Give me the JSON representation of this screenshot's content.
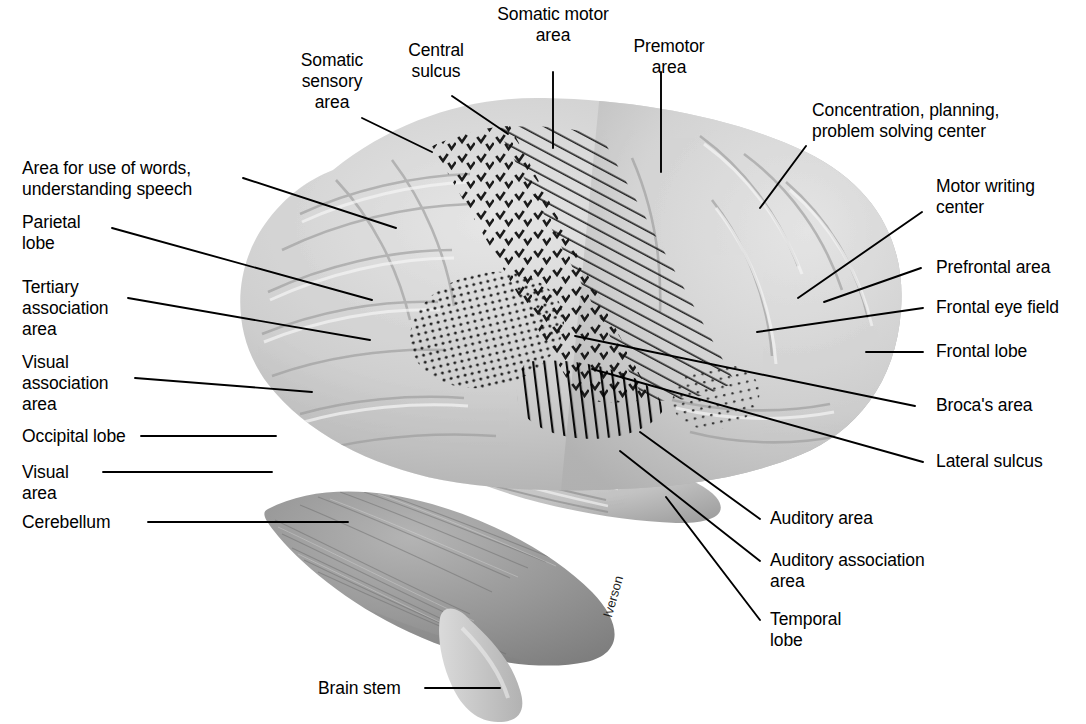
{
  "figure": {
    "type": "anatomical-diagram",
    "background_color": "#ffffff",
    "artist_signature": "Iverson"
  },
  "colors": {
    "ink": "#000000",
    "leader_line": "#000000",
    "cortex_light": "#d9d9d9",
    "cortex_mid": "#bdbdbd",
    "cortex_dark": "#a3a3a3",
    "cerebellum": "#8f8f8f",
    "brainstem": "#c9c9c9"
  },
  "labels": {
    "left": [
      {
        "name": "somatic-sensory-area",
        "text": "Somatic\nsensory\narea"
      },
      {
        "name": "central-sulcus",
        "text": "Central\nsulcus"
      },
      {
        "name": "area-for-use-of-words",
        "text": "Area for use of words,\nunderstanding speech"
      },
      {
        "name": "parietal-lobe",
        "text": "Parietal\nlobe"
      },
      {
        "name": "tertiary-association-area",
        "text": "Tertiary\nassociation\narea"
      },
      {
        "name": "visual-association-area",
        "text": "Visual\nassociation\narea"
      },
      {
        "name": "occipital-lobe",
        "text": "Occipital lobe"
      },
      {
        "name": "visual-area",
        "text": "Visual\narea"
      },
      {
        "name": "cerebellum",
        "text": "Cerebellum"
      },
      {
        "name": "brain-stem",
        "text": "Brain stem"
      }
    ],
    "top": [
      {
        "name": "somatic-motor-area",
        "text": "Somatic motor\narea"
      },
      {
        "name": "premotor-area",
        "text": "Premotor\narea"
      }
    ],
    "right": [
      {
        "name": "concentration-planning-center",
        "text": "Concentration, planning,\nproblem solving center"
      },
      {
        "name": "motor-writing-center",
        "text": "Motor writing\ncenter"
      },
      {
        "name": "prefrontal-area",
        "text": "Prefrontal area"
      },
      {
        "name": "frontal-eye-field",
        "text": "Frontal eye field"
      },
      {
        "name": "frontal-lobe",
        "text": "Frontal lobe"
      },
      {
        "name": "brocas-area",
        "text": "Broca's area"
      },
      {
        "name": "lateral-sulcus",
        "text": "Lateral sulcus"
      },
      {
        "name": "auditory-area",
        "text": "Auditory area"
      },
      {
        "name": "auditory-association-area",
        "text": "Auditory association\narea"
      },
      {
        "name": "temporal-lobe",
        "text": "Temporal\nlobe"
      }
    ]
  },
  "regions": {
    "somatic_sensory": {
      "pattern": "check-marks",
      "label": "Somatic sensory area"
    },
    "somatic_motor": {
      "pattern": "diagonal-hatch",
      "label": "Somatic motor area"
    },
    "visual_association": {
      "pattern": "dense-dots",
      "label": "Visual association area"
    },
    "brocas": {
      "pattern": "sparse-dots",
      "label": "Broca's area"
    },
    "auditory": {
      "pattern": "vertical-bars",
      "label": "Auditory area"
    }
  }
}
